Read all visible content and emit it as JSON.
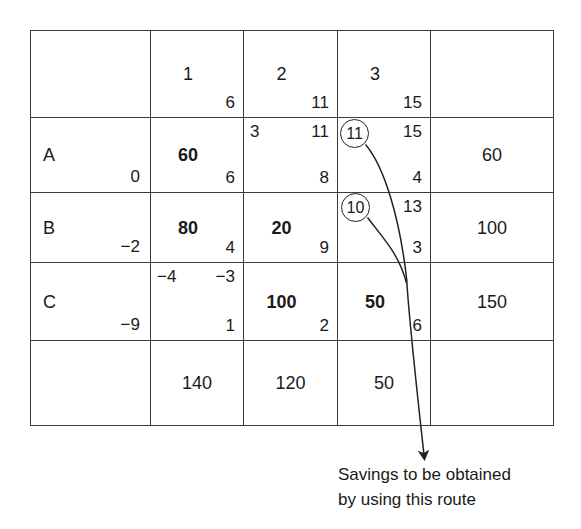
{
  "figure": {
    "type": "transportation-tableau",
    "title": ""
  },
  "table": {
    "corner_cell": "",
    "column_headers": [
      {
        "index": "1",
        "cost": "6"
      },
      {
        "index": "2",
        "cost": "11"
      },
      {
        "index": "3",
        "cost": "15"
      }
    ],
    "supply_header": "",
    "rows": [
      {
        "label": "A",
        "dual": "0",
        "supply": "60",
        "cells": [
          {
            "top_left": "",
            "top_right": "",
            "allocation": "60",
            "allocation_bold": true,
            "cost": "6"
          },
          {
            "top_left": "3",
            "top_right": "11",
            "allocation": "",
            "allocation_bold": false,
            "cost": "8"
          },
          {
            "top_left": "",
            "top_right": "15",
            "allocation": "",
            "allocation_bold": false,
            "cost": "4"
          }
        ]
      },
      {
        "label": "B",
        "dual": "−2",
        "supply": "100",
        "cells": [
          {
            "top_left": "",
            "top_right": "",
            "allocation": "80",
            "allocation_bold": true,
            "cost": "4"
          },
          {
            "top_left": "",
            "top_right": "",
            "allocation": "20",
            "allocation_bold": true,
            "cost": "9"
          },
          {
            "top_left": "",
            "top_right": "13",
            "allocation": "",
            "allocation_bold": false,
            "cost": "3"
          }
        ]
      },
      {
        "label": "C",
        "dual": "−9",
        "supply": "150",
        "cells": [
          {
            "top_left": "−4",
            "top_right": "−3",
            "allocation": "",
            "allocation_bold": false,
            "cost": "1"
          },
          {
            "top_left": "",
            "top_right": "",
            "allocation": "100",
            "allocation_bold": true,
            "cost": "2"
          },
          {
            "top_left": "",
            "top_right": "",
            "allocation": "50",
            "allocation_bold": true,
            "cost": "6"
          }
        ]
      }
    ],
    "demand_label": "",
    "demands": [
      "140",
      "120",
      "50"
    ],
    "demand_corner": ""
  },
  "annotations": {
    "circled_values": [
      {
        "id": "a3",
        "value": "11"
      },
      {
        "id": "b3",
        "value": "10"
      }
    ],
    "caption_line1": "Savings to be obtained",
    "caption_line2": "by using this route"
  },
  "colors": {
    "border": "#3c3c3c",
    "text": "#1a1a1a",
    "background": "#ffffff",
    "annotation": "#222222"
  }
}
